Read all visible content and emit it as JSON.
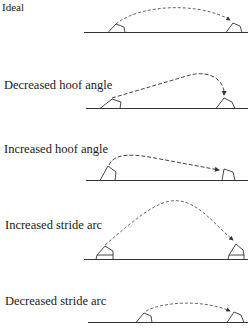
{
  "figure": {
    "panels": [
      {
        "label": "Ideal"
      },
      {
        "label": "Decreased hoof angle"
      },
      {
        "label": "Increased hoof angle"
      },
      {
        "label": "Increased stride arc"
      },
      {
        "label": "Decreased stride arc"
      }
    ],
    "colors": {
      "line": "#333333",
      "dashed_path": "#555555",
      "background": "#ffffff"
    }
  }
}
